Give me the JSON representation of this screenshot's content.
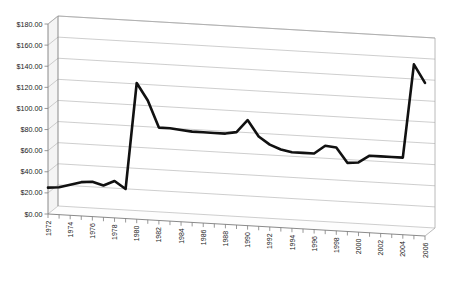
{
  "chart_data": {
    "type": "line",
    "title": "",
    "subtitle": "",
    "xlabel": "",
    "ylabel": "",
    "ylim": [
      0,
      180
    ],
    "ytick_step": 20,
    "grid": true,
    "legend": false,
    "legend_position": "none",
    "style": "3d-perspective",
    "line_color": "#111111",
    "gridline_color": "#b9b9b9",
    "background_color": "#ffffff",
    "y_tick_labels": [
      "$0.00",
      "$20.00",
      "$40.00",
      "$60.00",
      "$80.00",
      "$100.00",
      "$120.00",
      "$140.00",
      "$160.00",
      "$180.00"
    ],
    "y_tick_values": [
      0,
      20,
      40,
      60,
      80,
      100,
      120,
      140,
      160,
      180
    ],
    "x_tick_labels": [
      "1972",
      "1974",
      "1976",
      "1978",
      "1980",
      "1982",
      "1984",
      "1986",
      "1988",
      "1990",
      "1992",
      "1994",
      "1996",
      "1998",
      "2000",
      "2002",
      "2004",
      "2006"
    ],
    "x_label_rotation": -90,
    "x": [
      1972,
      1973,
      1974,
      1975,
      1976,
      1977,
      1978,
      1979,
      1980,
      1981,
      1982,
      1983,
      1984,
      1985,
      1986,
      1987,
      1988,
      1989,
      1990,
      1991,
      1992,
      1993,
      1994,
      1995,
      1996,
      1997,
      1998,
      1999,
      2000,
      2001,
      2002,
      2003,
      2004,
      2005,
      2006
    ],
    "values": [
      25,
      26,
      29,
      32,
      33,
      30,
      35,
      28,
      129,
      113,
      88,
      88,
      87,
      86,
      86,
      86,
      86,
      88,
      100,
      85,
      78,
      74,
      72,
      72,
      72,
      80,
      79,
      65,
      66,
      73,
      73,
      73,
      73,
      162,
      145
    ],
    "series": [
      {
        "name": "price",
        "values": [
          25,
          26,
          29,
          32,
          33,
          30,
          35,
          28,
          129,
          113,
          88,
          88,
          87,
          86,
          86,
          86,
          86,
          88,
          100,
          85,
          78,
          74,
          72,
          72,
          72,
          80,
          79,
          65,
          66,
          73,
          73,
          73,
          73,
          162,
          145
        ]
      }
    ],
    "annotations": []
  }
}
